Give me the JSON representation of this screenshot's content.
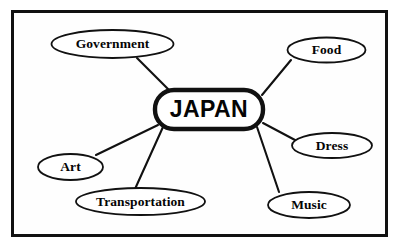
{
  "diagram": {
    "type": "concept-web-map",
    "title_node": {
      "id": "center",
      "label": "JAPAN",
      "shape": "rounded-rectangle",
      "x": 155,
      "y": 90,
      "w": 108,
      "h": 39,
      "rx": 19
    },
    "frame": {
      "border_color": "#111111",
      "background_color": "#fefefe",
      "border_width": 3
    },
    "colors": {
      "line": "#111111",
      "node_fill": "#ffffff",
      "text": "#050505",
      "page_background": "#ffffff"
    },
    "nodes": [
      {
        "id": "government",
        "label": "Government",
        "shape": "oval",
        "cx": 112.5,
        "cy": 44,
        "rx": 61,
        "ry": 14
      },
      {
        "id": "food",
        "label": "Food",
        "shape": "oval",
        "cx": 326.5,
        "cy": 50,
        "rx": 39,
        "ry": 12.5
      },
      {
        "id": "dress",
        "label": "Dress",
        "shape": "oval",
        "cx": 332,
        "cy": 145.5,
        "rx": 40,
        "ry": 12.5
      },
      {
        "id": "music",
        "label": "Music",
        "shape": "oval",
        "cx": 309,
        "cy": 205,
        "rx": 41,
        "ry": 13
      },
      {
        "id": "transportation",
        "label": "Transportation",
        "shape": "oval",
        "cx": 140.5,
        "cy": 201.5,
        "rx": 64.5,
        "ry": 13.5
      },
      {
        "id": "art",
        "label": "Art",
        "shape": "oval",
        "cx": 70.5,
        "cy": 167,
        "rx": 32.5,
        "ry": 13
      }
    ],
    "edges": [
      {
        "id": "edge-center-government",
        "from": "center",
        "to": "government",
        "x1": 172,
        "y1": 93,
        "x2": 137,
        "y2": 58
      },
      {
        "id": "edge-center-food",
        "from": "center",
        "to": "food",
        "x1": 262,
        "y1": 95,
        "x2": 291,
        "y2": 60
      },
      {
        "id": "edge-center-dress",
        "from": "center",
        "to": "dress",
        "x1": 263,
        "y1": 123,
        "x2": 295,
        "y2": 140
      },
      {
        "id": "edge-center-music",
        "from": "center",
        "to": "music",
        "x1": 257,
        "y1": 127,
        "x2": 279,
        "y2": 192
      },
      {
        "id": "edge-center-transportation",
        "from": "center",
        "to": "transportation",
        "x1": 163,
        "y1": 127,
        "x2": 135,
        "y2": 189
      },
      {
        "id": "edge-center-art",
        "from": "center",
        "to": "art",
        "x1": 158,
        "y1": 125,
        "x2": 96,
        "y2": 155
      }
    ]
  }
}
